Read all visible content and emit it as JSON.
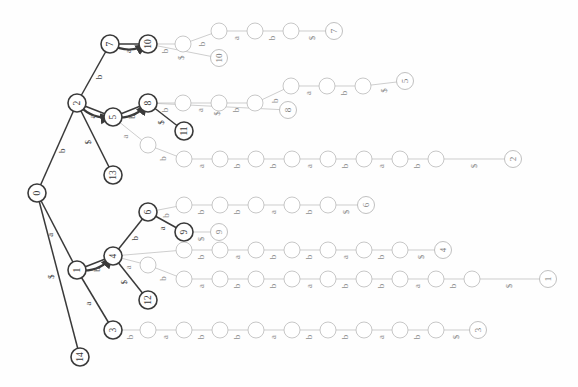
{
  "figure": {
    "orientation": "rotated-90-ccw",
    "background_color": "#ffffff",
    "stroke_strong": "#3a3a3a",
    "stroke_light": "#b9b9b9",
    "text_color": "#4a4a4a",
    "node_fill": "#ffffff"
  },
  "legend": {
    "alphabet": [
      "a",
      "b",
      "$"
    ],
    "terminal_symbol": "$"
  },
  "chart_data": {
    "type": "diagram",
    "graph_kind": "suffix-trie",
    "node_radius_internal": 9,
    "node_radius_plain": 8,
    "nodes": [
      {
        "id": "n0",
        "label": "0",
        "x": 37,
        "y": 193,
        "style": "strong",
        "kind": "root"
      },
      {
        "id": "n2",
        "label": "2",
        "x": 77,
        "y": 103,
        "style": "strong",
        "kind": "internal"
      },
      {
        "id": "n1",
        "label": "1",
        "x": 77,
        "y": 270,
        "style": "strong",
        "kind": "internal"
      },
      {
        "id": "n14",
        "label": "14",
        "x": 80,
        "y": 357,
        "style": "strong",
        "kind": "leaf"
      },
      {
        "id": "n7",
        "label": "7",
        "x": 110,
        "y": 44,
        "style": "strong",
        "kind": "internal"
      },
      {
        "id": "n13",
        "label": "13",
        "x": 113,
        "y": 175,
        "style": "strong",
        "kind": "leaf"
      },
      {
        "id": "n5",
        "label": "5",
        "x": 113,
        "y": 117,
        "style": "strong",
        "kind": "internal"
      },
      {
        "id": "n4",
        "label": "4",
        "x": 113,
        "y": 256,
        "style": "strong",
        "kind": "internal"
      },
      {
        "id": "n3",
        "label": "3",
        "x": 113,
        "y": 330,
        "style": "strong",
        "kind": "internal"
      },
      {
        "id": "n10",
        "label": "10",
        "x": 148,
        "y": 44,
        "style": "strong",
        "kind": "internal"
      },
      {
        "id": "n8",
        "label": "8",
        "x": 148,
        "y": 103,
        "style": "strong",
        "kind": "internal"
      },
      {
        "id": "n6",
        "label": "6",
        "x": 148,
        "y": 212,
        "style": "strong",
        "kind": "internal"
      },
      {
        "id": "n12",
        "label": "12",
        "x": 148,
        "y": 300,
        "style": "strong",
        "kind": "leaf"
      },
      {
        "id": "n11",
        "label": "11",
        "x": 184,
        "y": 131,
        "style": "strong",
        "kind": "leaf"
      },
      {
        "id": "n9",
        "label": "9",
        "x": 184,
        "y": 232,
        "style": "strong",
        "kind": "leaf"
      }
    ],
    "leaf_terminals": [
      {
        "label": "7",
        "x": 334,
        "y": 31
      },
      {
        "label": "10",
        "x": 219,
        "y": 58
      },
      {
        "label": "5",
        "x": 405,
        "y": 81
      },
      {
        "label": "8",
        "x": 288,
        "y": 110
      },
      {
        "label": "2",
        "x": 513,
        "y": 159
      },
      {
        "label": "6",
        "x": 366,
        "y": 205
      },
      {
        "label": "9",
        "x": 219,
        "y": 232
      },
      {
        "label": "4",
        "x": 443,
        "y": 250
      },
      {
        "label": "1",
        "x": 548,
        "y": 279
      },
      {
        "label": "3",
        "x": 478,
        "y": 330
      }
    ],
    "tree_edges": [
      {
        "from": "n0",
        "to": "n2",
        "label": "b",
        "style": "strong"
      },
      {
        "from": "n0",
        "to": "n1",
        "label": "a",
        "style": "strong"
      },
      {
        "from": "n0",
        "to": "n14",
        "label": "$",
        "style": "strong"
      },
      {
        "from": "n2",
        "to": "n7",
        "label": "b",
        "style": "strong"
      },
      {
        "from": "n2",
        "to": "n5",
        "label": "a",
        "style": "strong"
      },
      {
        "from": "n2",
        "to": "n13",
        "label": "$",
        "style": "strong"
      },
      {
        "from": "n7",
        "to": "n10",
        "label": "a",
        "style": "strong"
      },
      {
        "from": "n5",
        "to": "n8",
        "label": "b",
        "style": "strong"
      },
      {
        "from": "n8",
        "to": "n11",
        "label": "$",
        "style": "strong"
      },
      {
        "from": "n1",
        "to": "n4",
        "label": "b",
        "style": "strong"
      },
      {
        "from": "n1",
        "to": "n3",
        "label": "a",
        "style": "strong"
      },
      {
        "from": "n4",
        "to": "n6",
        "label": "b",
        "style": "strong"
      },
      {
        "from": "n4",
        "to": "n12",
        "label": "$",
        "style": "strong"
      },
      {
        "from": "n6",
        "to": "n9",
        "label": "a",
        "style": "strong"
      }
    ],
    "suffix_links": [
      {
        "from": "n7",
        "to": "n10",
        "curve": "arc"
      },
      {
        "from": "n2",
        "to": "n5",
        "curve": "arc"
      },
      {
        "from": "n5",
        "to": "n8",
        "curve": "arc"
      },
      {
        "from": "n1",
        "to": "n4",
        "curve": "arc"
      }
    ],
    "chains": [
      {
        "id": "c_top_a",
        "start_node": "n10",
        "y": 31,
        "path": [
          {
            "label": "b",
            "cx": 183,
            "cy": 44
          },
          {
            "label": "b",
            "cx": 219,
            "cy": 31
          },
          {
            "label": "a",
            "cx": 255,
            "cy": 31
          },
          {
            "label": "b",
            "cx": 291,
            "cy": 31
          },
          {
            "label": "$",
            "cx": 334,
            "cy": 31
          }
        ],
        "terminal": "7"
      },
      {
        "id": "c_top_b",
        "start_node": "n10",
        "y": 58,
        "path": [
          {
            "label": "$",
            "cx": 219,
            "cy": 58
          }
        ],
        "terminal": "10"
      },
      {
        "id": "c_mid_a",
        "start_node": "n8",
        "y": 86,
        "path": [
          {
            "label": "b",
            "cx": 183,
            "cy": 103
          },
          {
            "label": "a",
            "cx": 219,
            "cy": 103
          },
          {
            "label": "b",
            "cx": 255,
            "cy": 103
          },
          {
            "label": "b",
            "cx": 291,
            "cy": 86
          },
          {
            "label": "a",
            "cx": 327,
            "cy": 86
          },
          {
            "label": "b",
            "cx": 363,
            "cy": 86
          },
          {
            "label": "$",
            "cx": 405,
            "cy": 81
          }
        ],
        "terminal": "5"
      },
      {
        "id": "c_mid_b",
        "start_node": "n8",
        "y": 110,
        "path": [
          {
            "label": "$",
            "cx": 288,
            "cy": 110
          }
        ],
        "terminal": "8"
      },
      {
        "id": "c_5a",
        "start_node": "n5",
        "y": 159,
        "path": [
          {
            "label": "a",
            "cx": 148,
            "cy": 145
          },
          {
            "label": "b",
            "cx": 184,
            "cy": 159
          },
          {
            "label": "a",
            "cx": 220,
            "cy": 159
          },
          {
            "label": "b",
            "cx": 256,
            "cy": 159
          },
          {
            "label": "b",
            "cx": 292,
            "cy": 159
          },
          {
            "label": "a",
            "cx": 328,
            "cy": 159
          },
          {
            "label": "b",
            "cx": 364,
            "cy": 159
          },
          {
            "label": "a",
            "cx": 400,
            "cy": 159
          },
          {
            "label": "b",
            "cx": 436,
            "cy": 159
          },
          {
            "label": "$",
            "cx": 513,
            "cy": 159
          }
        ],
        "terminal": "2"
      },
      {
        "id": "c_6a",
        "start_node": "n6",
        "y": 205,
        "path": [
          {
            "label": "b",
            "cx": 184,
            "cy": 205
          },
          {
            "label": "b",
            "cx": 220,
            "cy": 205
          },
          {
            "label": "b",
            "cx": 256,
            "cy": 205
          },
          {
            "label": "a",
            "cx": 292,
            "cy": 205
          },
          {
            "label": "b",
            "cx": 328,
            "cy": 205
          },
          {
            "label": "$",
            "cx": 366,
            "cy": 205
          }
        ],
        "terminal": "6"
      },
      {
        "id": "c_9a",
        "start_node": "n9",
        "y": 232,
        "path": [
          {
            "label": "b",
            "cx": 184,
            "cy": 232
          },
          {
            "label": "$",
            "cx": 219,
            "cy": 232
          }
        ],
        "terminal": "9"
      },
      {
        "id": "c_4a",
        "start_node": "n4",
        "y": 250,
        "path": [
          {
            "label": "b",
            "cx": 184,
            "cy": 250
          },
          {
            "label": "b",
            "cx": 220,
            "cy": 250
          },
          {
            "label": "a",
            "cx": 256,
            "cy": 250
          },
          {
            "label": "b",
            "cx": 292,
            "cy": 250
          },
          {
            "label": "b",
            "cx": 328,
            "cy": 250
          },
          {
            "label": "a",
            "cx": 364,
            "cy": 250
          },
          {
            "label": "b",
            "cx": 400,
            "cy": 250
          },
          {
            "label": "$",
            "cx": 443,
            "cy": 250
          }
        ],
        "terminal": "4"
      },
      {
        "id": "c_4b",
        "start_node": "n4",
        "y": 279,
        "path": [
          {
            "label": "a",
            "cx": 148,
            "cy": 265
          },
          {
            "label": "b",
            "cx": 184,
            "cy": 279
          },
          {
            "label": "a",
            "cx": 220,
            "cy": 279
          },
          {
            "label": "b",
            "cx": 256,
            "cy": 279
          },
          {
            "label": "b",
            "cx": 292,
            "cy": 279
          },
          {
            "label": "a",
            "cx": 328,
            "cy": 279
          },
          {
            "label": "b",
            "cx": 364,
            "cy": 279
          },
          {
            "label": "b",
            "cx": 400,
            "cy": 279
          },
          {
            "label": "a",
            "cx": 436,
            "cy": 279
          },
          {
            "label": "b",
            "cx": 472,
            "cy": 279
          },
          {
            "label": "$",
            "cx": 548,
            "cy": 279
          }
        ],
        "terminal": "1"
      },
      {
        "id": "c_3a",
        "start_node": "n3",
        "y": 330,
        "path": [
          {
            "label": "b",
            "cx": 148,
            "cy": 330
          },
          {
            "label": "a",
            "cx": 184,
            "cy": 330
          },
          {
            "label": "b",
            "cx": 220,
            "cy": 330
          },
          {
            "label": "b",
            "cx": 256,
            "cy": 330
          },
          {
            "label": "a",
            "cx": 292,
            "cy": 330
          },
          {
            "label": "b",
            "cx": 328,
            "cy": 330
          },
          {
            "label": "b",
            "cx": 364,
            "cy": 330
          },
          {
            "label": "a",
            "cx": 400,
            "cy": 330
          },
          {
            "label": "b",
            "cx": 436,
            "cy": 330
          },
          {
            "label": "$",
            "cx": 478,
            "cy": 330
          }
        ],
        "terminal": "3"
      }
    ],
    "edge_label_counts": {
      "a": 22,
      "b": 43,
      "$": 11
    },
    "title": "",
    "xlabel": "",
    "ylabel": ""
  }
}
